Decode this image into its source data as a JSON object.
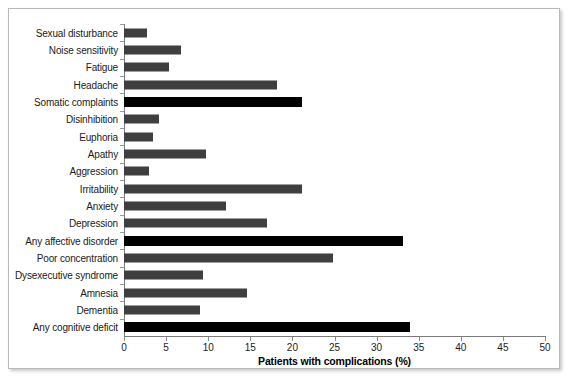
{
  "chart_data": {
    "type": "bar",
    "orientation": "horizontal",
    "title": "",
    "xlabel": "Patients with complications (%)",
    "ylabel": "",
    "xlim": [
      0,
      50
    ],
    "xticks": [
      0,
      5,
      10,
      15,
      20,
      25,
      30,
      35,
      40,
      45,
      50
    ],
    "grid": false,
    "legend": false,
    "colors": {
      "bar": "#3f3f3f",
      "highlight_bar": "#000000",
      "axis": "#7a7a7a",
      "frame": "#b9b9b9",
      "background": "#ffffff",
      "text": "#1b1b1b"
    },
    "categories": [
      "Sexual disturbance",
      "Noise sensitivity",
      "Fatigue",
      "Headache",
      "Somatic complaints",
      "Disinhibition",
      "Euphoria",
      "Apathy",
      "Aggression",
      "Irritability",
      "Anxiety",
      "Depression",
      "Any affective disorder",
      "Poor concentration",
      "Dysexecutive syndrome",
      "Amnesia",
      "Dementia",
      "Any cognitive deficit"
    ],
    "values": [
      2.7,
      6.8,
      5.3,
      18.2,
      21.1,
      4.2,
      3.5,
      9.7,
      3.0,
      21.1,
      12.1,
      17.0,
      33.1,
      24.8,
      9.4,
      14.6,
      9.0,
      34.0
    ],
    "highlight": [
      false,
      false,
      false,
      false,
      true,
      false,
      false,
      false,
      false,
      false,
      false,
      false,
      true,
      false,
      false,
      false,
      false,
      true
    ],
    "highlight_note": "Summary/aggregate categories are drawn in solid black"
  }
}
